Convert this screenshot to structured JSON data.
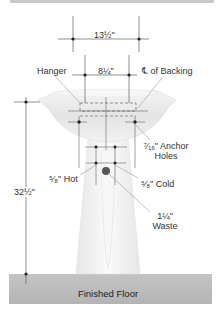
{
  "dimensions": {
    "anchor_spacing": "13½\"",
    "hanger_spacing": "8¼\"",
    "rim_height": "32½\""
  },
  "labels": {
    "hanger": "Hanger",
    "centerline_symbol": "℄",
    "centerline": "of Backing",
    "anchor_size": "⁷⁄₁₆\" Anchor",
    "anchor_holes": "Holes",
    "hot": "⁵⁄₈\" Hot",
    "cold": "⁵⁄₈\" Cold",
    "waste_size": "1¼\"",
    "waste": "Waste",
    "floor": "Finished Floor"
  },
  "colors": {
    "line": "#333333",
    "leader": "#9a9a9a",
    "sink": "#ebebeb",
    "floor": "#bdbdbd"
  }
}
